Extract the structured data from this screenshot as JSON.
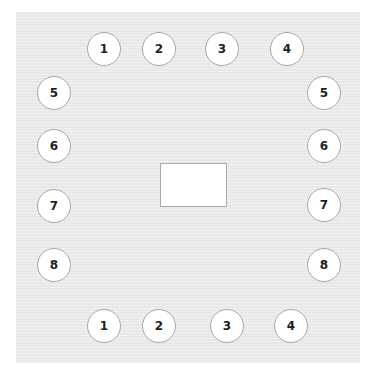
{
  "diagram": {
    "type": "seating-layout",
    "colors": {
      "page_background": "#ffffff",
      "floor_background": "#ebebeb",
      "seat_fill": "#ffffff",
      "seat_border": "#a8a8a8",
      "label_color": "#1e1e1e",
      "table_fill": "#ffffff",
      "table_border": "#a9a9a9"
    },
    "table": {
      "label": ""
    },
    "seats": {
      "top": [
        {
          "label": "1",
          "x": 104,
          "y": 49
        },
        {
          "label": "2",
          "x": 159,
          "y": 49
        },
        {
          "label": "3",
          "x": 222,
          "y": 49
        },
        {
          "label": "4",
          "x": 287,
          "y": 49
        }
      ],
      "left": [
        {
          "label": "5",
          "x": 54,
          "y": 93
        },
        {
          "label": "6",
          "x": 54,
          "y": 146
        },
        {
          "label": "7",
          "x": 54,
          "y": 206
        },
        {
          "label": "8",
          "x": 54,
          "y": 265
        }
      ],
      "right": [
        {
          "label": "5",
          "x": 324,
          "y": 93
        },
        {
          "label": "6",
          "x": 324,
          "y": 146
        },
        {
          "label": "7",
          "x": 324,
          "y": 205
        },
        {
          "label": "8",
          "x": 324,
          "y": 265
        }
      ],
      "bottom": [
        {
          "label": "1",
          "x": 104,
          "y": 326
        },
        {
          "label": "2",
          "x": 159,
          "y": 326
        },
        {
          "label": "3",
          "x": 227,
          "y": 326
        },
        {
          "label": "4",
          "x": 291,
          "y": 326
        }
      ]
    }
  }
}
